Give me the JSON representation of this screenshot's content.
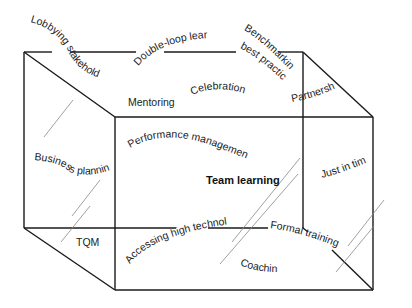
{
  "diagram": {
    "type": "3d-box-concept-map",
    "center_label": "Team learning",
    "labels": [
      {
        "id": "lobbying",
        "text": "Lobbying stakeholders"
      },
      {
        "id": "double-loop",
        "text": "Double-loop learning"
      },
      {
        "id": "benchmarking",
        "text": "Benchmarking"
      },
      {
        "id": "best-practice",
        "text": "best practice"
      },
      {
        "id": "mentoring",
        "text": "Mentoring"
      },
      {
        "id": "celebration",
        "text": "Celebration"
      },
      {
        "id": "partnership",
        "text": "Partnership"
      },
      {
        "id": "performance",
        "text": "Performance management"
      },
      {
        "id": "business-planning",
        "text": "Business planning"
      },
      {
        "id": "just-in-time",
        "text": "Just in time"
      },
      {
        "id": "tqm",
        "text": "TQM"
      },
      {
        "id": "accessing",
        "text": "Accessing high technology"
      },
      {
        "id": "formal-training",
        "text": "Formal training"
      },
      {
        "id": "coaching",
        "text": "Coaching"
      }
    ],
    "colors": {
      "line": "#1a1a1a",
      "glass": "#777777",
      "text": "#222222",
      "background": "#ffffff"
    }
  }
}
